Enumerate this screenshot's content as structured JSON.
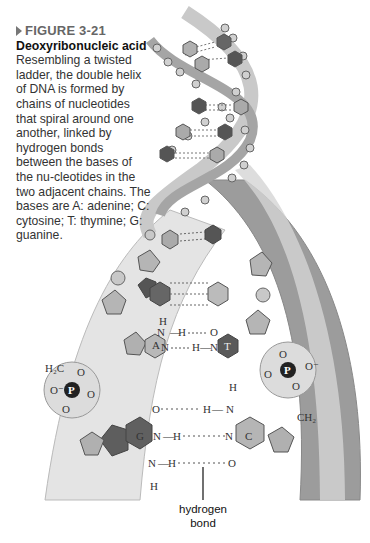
{
  "figure": {
    "label": "FIGURE 3-21",
    "title": "Deoxyribonucleic acid",
    "body": "Resembling a twisted ladder, the double helix of DNA is formed by chains of nucleotides that spiral around one another, linked by hydrogen bonds between the bases of the nu-cleotides in the two adjacent chains. The bases are A: adenine; C: cytosine; T: thymine; G: guanine."
  },
  "diagram": {
    "annotation": {
      "line1": "hydrogen",
      "line2": "bond"
    },
    "bases": {
      "a": "A",
      "t": "T",
      "g": "G",
      "c": "C"
    },
    "phosphate": "P",
    "atoms": {
      "h": "H",
      "n": "N",
      "o": "O",
      "ch2_left": "H₂C",
      "ch2_right": "CH₂",
      "o_minus": "O⁻"
    },
    "colors": {
      "light_base": "#b8b8b8",
      "dark_base": "#6a6a6a",
      "sugar": "#a9a9a9",
      "backbone_light": "#dcdcdc",
      "backbone_dark": "#a0a0a0",
      "phosphate_sphere": "#d9d9d9"
    }
  }
}
